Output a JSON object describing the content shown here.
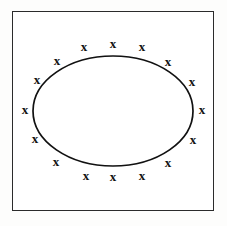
{
  "figure": {
    "width": 227,
    "height": 226,
    "background_color": "#fdfdfc",
    "panel": {
      "name": "outer-frame",
      "x": 12,
      "y": 11,
      "width": 202,
      "height": 200,
      "border_color": "#2b2b2b",
      "border_width": 1.6,
      "fill_color": "#ffffff"
    }
  },
  "diagram": {
    "type": "annotated-ellipse",
    "ellipse": {
      "name": "center-ellipse",
      "cx": 113,
      "cy": 111,
      "rx": 80,
      "ry": 55,
      "stroke_color": "#111111",
      "stroke_width": 1.7,
      "fill": "none"
    },
    "marker": {
      "glyph": "x",
      "label": "x",
      "count": 20,
      "color": "#111111",
      "font_size": 13,
      "bold": true
    },
    "markers": [
      {
        "label": "x",
        "x": 113,
        "y": 44
      },
      {
        "label": "x",
        "x": 142,
        "y": 47
      },
      {
        "label": "x",
        "x": 168,
        "y": 62
      },
      {
        "label": "x",
        "x": 192,
        "y": 82
      },
      {
        "label": "x",
        "x": 202,
        "y": 110
      },
      {
        "label": "x",
        "x": 193,
        "y": 140
      },
      {
        "label": "x",
        "x": 168,
        "y": 163
      },
      {
        "label": "x",
        "x": 142,
        "y": 176
      },
      {
        "label": "x",
        "x": 113,
        "y": 177
      },
      {
        "label": "x",
        "x": 86,
        "y": 176
      },
      {
        "label": "x",
        "x": 56,
        "y": 162
      },
      {
        "label": "x",
        "x": 35,
        "y": 139
      },
      {
        "label": "x",
        "x": 25,
        "y": 110
      },
      {
        "label": "x",
        "x": 37,
        "y": 80
      },
      {
        "label": "x",
        "x": 57,
        "y": 61
      },
      {
        "label": "x",
        "x": 84,
        "y": 47
      }
    ]
  }
}
